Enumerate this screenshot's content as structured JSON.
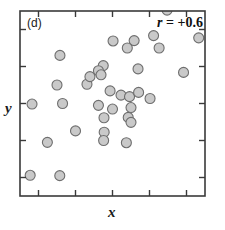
{
  "figure": {
    "panel_label": "(d)",
    "annotation_symbol": "r",
    "annotation_relation": " = ",
    "annotation_value": "+0.6",
    "annotation_full": "r = +0.6",
    "xlabel": "x",
    "ylabel": "y",
    "marker_fill": "#c9c9c9",
    "marker_stroke": "#6e6e6e",
    "frame_color": "#3a3a3a",
    "background": "#ffffff"
  },
  "chart_data": {
    "type": "scatter",
    "title": "",
    "subtitle": "",
    "panel": "(d)",
    "xlabel": "x",
    "ylabel": "y",
    "annotations": [
      {
        "text": "(d)",
        "position": "top-left"
      },
      {
        "text": "r = +0.6",
        "position": "top-right"
      }
    ],
    "correlation": 0.6,
    "grid": false,
    "legend": null,
    "xlim": [
      0,
      1
    ],
    "ylim": [
      0,
      1
    ],
    "xticks": [
      0.1,
      0.3,
      0.5,
      0.7,
      0.9
    ],
    "yticks": [
      0.1,
      0.3,
      0.5,
      0.7,
      0.9
    ],
    "xtick_labels": [],
    "ytick_labels": [],
    "tick_direction": "in",
    "frame": "full-box",
    "n_points": 36,
    "marker": {
      "shape": "circle",
      "size": 10,
      "fill": "#c9c9c9",
      "edge": "#6e6e6e"
    },
    "points": [
      {
        "x": 0.795,
        "y": 1.005
      },
      {
        "x": 0.722,
        "y": 0.867
      },
      {
        "x": 0.966,
        "y": 0.855
      },
      {
        "x": 0.503,
        "y": 0.838
      },
      {
        "x": 0.617,
        "y": 0.84
      },
      {
        "x": 0.58,
        "y": 0.8
      },
      {
        "x": 0.752,
        "y": 0.8
      },
      {
        "x": 0.216,
        "y": 0.76
      },
      {
        "x": 0.45,
        "y": 0.705
      },
      {
        "x": 0.424,
        "y": 0.677
      },
      {
        "x": 0.438,
        "y": 0.655
      },
      {
        "x": 0.638,
        "y": 0.687
      },
      {
        "x": 0.884,
        "y": 0.668
      },
      {
        "x": 0.487,
        "y": 0.568
      },
      {
        "x": 0.546,
        "y": 0.545
      },
      {
        "x": 0.592,
        "y": 0.537
      },
      {
        "x": 0.641,
        "y": 0.56
      },
      {
        "x": 0.703,
        "y": 0.527
      },
      {
        "x": 0.065,
        "y": 0.497
      },
      {
        "x": 0.23,
        "y": 0.5
      },
      {
        "x": 0.424,
        "y": 0.49
      },
      {
        "x": 0.5,
        "y": 0.47
      },
      {
        "x": 0.6,
        "y": 0.478
      },
      {
        "x": 0.454,
        "y": 0.423
      },
      {
        "x": 0.585,
        "y": 0.425
      },
      {
        "x": 0.6,
        "y": 0.398
      },
      {
        "x": 0.3,
        "y": 0.352
      },
      {
        "x": 0.455,
        "y": 0.345
      },
      {
        "x": 0.452,
        "y": 0.3
      },
      {
        "x": 0.148,
        "y": 0.29
      },
      {
        "x": 0.575,
        "y": 0.288
      },
      {
        "x": 0.055,
        "y": 0.112
      },
      {
        "x": 0.215,
        "y": 0.11
      },
      {
        "x": 0.362,
        "y": 0.604
      },
      {
        "x": 0.378,
        "y": 0.645
      },
      {
        "x": 0.2,
        "y": 0.6
      }
    ]
  }
}
